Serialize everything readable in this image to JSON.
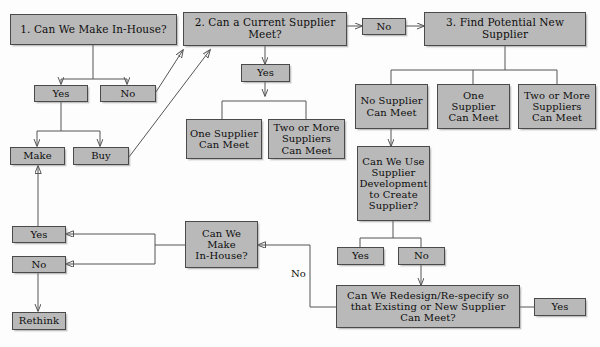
{
  "diagram": {
    "colors": {
      "node_fill": "#b9b9b9",
      "node_border": "#4a4a4a",
      "wire": "#555555",
      "background": "#fdfdfd",
      "text": "#0d0d0d"
    },
    "nodes": {
      "q1_make_in_house": "1. Can We Make In-House?",
      "q2_current_supplier": "2. Can a Current Supplier\nMeet?",
      "q2_no": "No",
      "q3_find_new_supplier": "3. Find Potential New\nSupplier",
      "q1_yes": "Yes",
      "q1_no": "No",
      "make": "Make",
      "buy": "Buy",
      "q2_yes": "Yes",
      "one_supplier_can_meet": "One Supplier\nCan Meet",
      "two_or_more_suppliers_can_meet": "Two or More\nSuppliers\nCan Meet",
      "no_supplier_can_meet": "No Supplier\nCan Meet",
      "one_supplier_can_meet_2": "One\nSupplier\nCan Meet",
      "two_or_more_suppliers_can_meet_2": "Two or More\nSuppliers\nCan Meet",
      "supplier_development": "Can We Use\nSupplier\nDevelopment\nto Create\nSupplier?",
      "dev_yes": "Yes",
      "dev_no": "No",
      "redesign": "Can We Redesign/Re-specify so\nthat Existing or New Supplier\nCan Meet?",
      "redesign_yes": "Yes",
      "make_in_house_again": "Can We\nMake\nIn-House?",
      "final_yes": "Yes",
      "final_no": "No",
      "rethink": "Rethink"
    },
    "edge_labels": {
      "redesign_no": "No"
    }
  }
}
